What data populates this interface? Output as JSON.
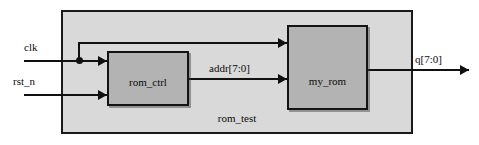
{
  "diagram": {
    "title": "rom_test",
    "type": "block-diagram",
    "container": {
      "name": "rom_test",
      "label": "rom_test",
      "fill_color": "#d9d9d9",
      "border_color": "#1a1a1a"
    },
    "blocks": [
      {
        "id": "rom_ctrl",
        "label": "rom_ctrl",
        "fill_color": "#b3b3b3",
        "border_color": "#141414"
      },
      {
        "id": "my_rom",
        "label": "my_rom",
        "fill_color": "#b3b3b3",
        "border_color": "#141414"
      }
    ],
    "inputs": [
      {
        "id": "clk",
        "label": "clk"
      },
      {
        "id": "rst_n",
        "label": "rst_n"
      }
    ],
    "outputs": [
      {
        "id": "q",
        "label": "q[7:0]"
      }
    ],
    "internal_signals": [
      {
        "id": "addr",
        "label": "addr[7:0]",
        "from": "rom_ctrl",
        "to": "my_rom"
      }
    ],
    "wire_color": "#101010"
  }
}
